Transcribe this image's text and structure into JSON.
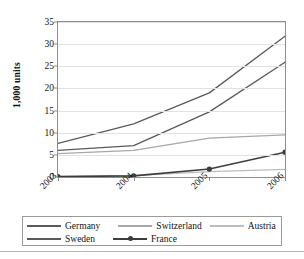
{
  "chart_data": {
    "type": "line",
    "title": "",
    "xlabel": "",
    "ylabel": "1,000 units",
    "categories": [
      "2003",
      "2004",
      "2005",
      "2006"
    ],
    "ylim": [
      0,
      35
    ],
    "yticks": [
      0,
      5,
      10,
      15,
      20,
      25,
      30,
      35
    ],
    "grid": true,
    "legend_position": "bottom",
    "series": [
      {
        "name": "Germany",
        "values": [
          7.6,
          12.0,
          19.0,
          31.8
        ],
        "color": "#5a5a5a",
        "marker": "none"
      },
      {
        "name": "Switzerland",
        "values": [
          5.3,
          6.0,
          8.8,
          9.5
        ],
        "color": "#a8a8a8",
        "marker": "none"
      },
      {
        "name": "Austria",
        "values": [
          0.1,
          0.3,
          1.2,
          1.7
        ],
        "color": "#bdbdbd",
        "marker": "none"
      },
      {
        "name": "Sweden",
        "values": [
          6.0,
          7.1,
          14.7,
          25.9
        ],
        "color": "#5a5a5a",
        "marker": "none"
      },
      {
        "name": "France",
        "values": [
          0.1,
          0.25,
          1.8,
          5.6
        ],
        "color": "#3d3d3d",
        "marker": "circle"
      }
    ]
  },
  "legend": {
    "rows": [
      [
        "Germany",
        "Switzerland",
        "Austria"
      ],
      [
        "Sweden",
        "France"
      ]
    ]
  },
  "axis": {
    "y_title": "1,000 units"
  }
}
